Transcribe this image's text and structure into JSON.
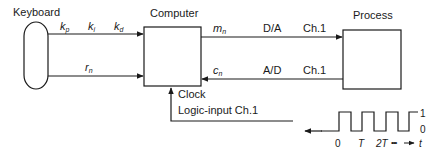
{
  "blocks": {
    "keyboard": {
      "label": "Keyboard"
    },
    "computer": {
      "label": "Computer"
    },
    "process": {
      "label": "Process"
    }
  },
  "signals": {
    "kp": {
      "base": "k",
      "sub": "p"
    },
    "ki": {
      "base": "k",
      "sub": "i"
    },
    "kd": {
      "base": "k",
      "sub": "d"
    },
    "rn": {
      "base": "r",
      "sub": "n"
    },
    "mn": {
      "base": "m",
      "sub": "n"
    },
    "cn": {
      "base": "c",
      "sub": "n"
    }
  },
  "channels": {
    "output": {
      "converter": "D/A",
      "channel": "Ch.1"
    },
    "input": {
      "converter": "A/D",
      "channel": "Ch.1"
    },
    "clock": {
      "label": "Clock",
      "channel": "Logic-input Ch.1"
    }
  },
  "pulse_train": {
    "levels": [
      "1",
      "0"
    ],
    "time_labels": [
      "0",
      "T",
      "2T"
    ],
    "ellipsis": "•••",
    "axis_label": "t"
  },
  "colors": {
    "stroke": "#1a1a1a",
    "background": "#ffffff"
  }
}
